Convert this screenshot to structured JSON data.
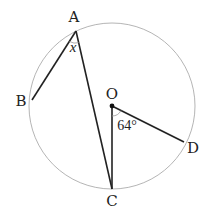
{
  "diagram": {
    "type": "circle-geometry",
    "circle": {
      "center_label": "O",
      "cx": 112,
      "cy": 106,
      "r": 83
    },
    "points": {
      "A": {
        "label": "A",
        "x": 76,
        "y": 31,
        "lx": 74,
        "ly": 22
      },
      "B": {
        "label": "B",
        "x": 32,
        "y": 100,
        "lx": 21,
        "ly": 106
      },
      "C": {
        "label": "C",
        "x": 112,
        "y": 189,
        "lx": 112,
        "ly": 206
      },
      "D": {
        "label": "D",
        "x": 184,
        "y": 142,
        "lx": 193,
        "ly": 153
      },
      "O": {
        "label": "O",
        "x": 112,
        "y": 106,
        "lx": 112,
        "ly": 99
      }
    },
    "segments": [
      {
        "from": "A",
        "to": "B"
      },
      {
        "from": "A",
        "to": "C"
      },
      {
        "from": "O",
        "to": "C"
      },
      {
        "from": "O",
        "to": "D"
      }
    ],
    "angles": {
      "x_label": "x",
      "x_at": "A",
      "angle_COD_label": "64°"
    },
    "colors": {
      "circle": "#b0b0b0",
      "segments": "#222222",
      "text": "#222222"
    }
  }
}
